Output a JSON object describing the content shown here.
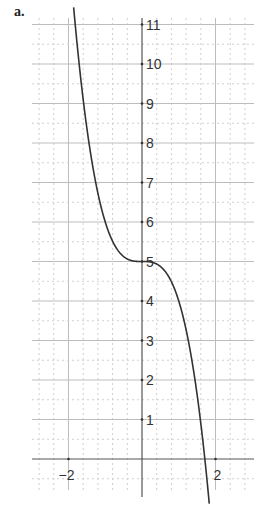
{
  "part_label": "a.",
  "chart_data": {
    "type": "line",
    "title": "",
    "xlabel": "",
    "ylabel": "",
    "function": "y = 5 - x^3",
    "xlim": [
      -2.98,
      3.06
    ],
    "ylim": [
      -0.78,
      11.4
    ],
    "x_ticks_labeled": [
      -2,
      2
    ],
    "y_ticks_labeled": [
      1,
      2,
      3,
      4,
      5,
      6,
      7,
      8,
      9,
      10,
      11
    ],
    "x_tick_labels": [
      "−2",
      "2"
    ],
    "y_tick_labels": [
      "1",
      "2",
      "3",
      "4",
      "5",
      "6",
      "7",
      "8",
      "9",
      "10",
      "11"
    ],
    "grid": true,
    "grid_major_y": 1,
    "grid_minor_y": 0.5,
    "grid_minor_x": 0.4,
    "series": [
      {
        "name": "y = 5 - x^3",
        "x": [
          -1.86,
          -1.6,
          -1.4,
          -1.2,
          -1.0,
          -0.8,
          -0.6,
          -0.4,
          -0.2,
          0,
          0.2,
          0.4,
          0.6,
          0.8,
          1.0,
          1.2,
          1.4,
          1.6,
          1.71,
          1.83
        ],
        "y": [
          11.43,
          9.1,
          7.74,
          6.73,
          6.0,
          5.51,
          5.22,
          5.06,
          5.01,
          5.0,
          4.99,
          4.94,
          4.78,
          4.49,
          4.0,
          3.27,
          2.26,
          0.9,
          0.0,
          -1.13
        ]
      }
    ]
  },
  "colors": {
    "curve": "#333333",
    "axis": "#555555",
    "grid_major": "#bdbdbd",
    "grid_minor": "#cfcfcf"
  }
}
